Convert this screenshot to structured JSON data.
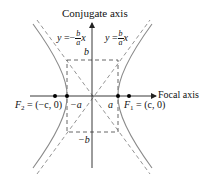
{
  "diagram": {
    "type": "hyperbola",
    "axes": {
      "vertical_label": "Conjugate axis",
      "horizontal_label": "Focal axis"
    },
    "asymptotes": {
      "negative": {
        "lhs": "y",
        "eq": "=",
        "sign": "−",
        "num": "b",
        "den": "a",
        "var": "x"
      },
      "positive": {
        "lhs": "y",
        "eq": "=",
        "sign": "",
        "num": "b",
        "den": "a",
        "var": "x"
      }
    },
    "box_labels": {
      "top": "b",
      "bottom": "−b",
      "left": "−a",
      "right": "a"
    },
    "foci": {
      "left": {
        "name": "F",
        "sub": "2",
        "coords": " = (−c, 0)"
      },
      "right": {
        "name": "F",
        "sub": "1",
        "coords": " = (c, 0)"
      }
    },
    "colors": {
      "axis": "#222222",
      "curve": "#8a8a8a",
      "dashed": "#777777",
      "point": "#000000"
    }
  }
}
